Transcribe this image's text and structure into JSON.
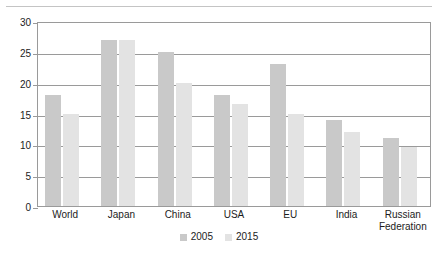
{
  "chart_data": {
    "type": "bar",
    "title": "",
    "subtitle": "",
    "xlabel": "",
    "ylabel": "",
    "ylim": [
      0,
      30
    ],
    "yticks": [
      0,
      5,
      10,
      15,
      20,
      25,
      30
    ],
    "ytick_labels": [
      "0",
      "5",
      "10",
      "15",
      "20",
      "25",
      "30"
    ],
    "grid": true,
    "grid_axis": "y",
    "legend_position": "bottom-center",
    "categories": [
      "World",
      "Japan",
      "China",
      "USA",
      "EU",
      "India",
      "Russian Federation"
    ],
    "series": [
      {
        "name": "2005",
        "color": "#c9c9c9",
        "values": [
          18,
          27,
          25,
          18,
          23,
          14,
          11
        ]
      },
      {
        "name": "2015",
        "color": "#e3e3e3",
        "values": [
          15,
          27,
          20,
          16.5,
          15,
          12,
          9.5
        ]
      }
    ]
  },
  "legend": {
    "items": [
      {
        "label": "2005",
        "color": "#c9c9c9"
      },
      {
        "label": "2015",
        "color": "#e3e3e3"
      }
    ]
  },
  "axis": {
    "line_color": "#9a9a9a",
    "text_color": "#1c1c1c"
  }
}
